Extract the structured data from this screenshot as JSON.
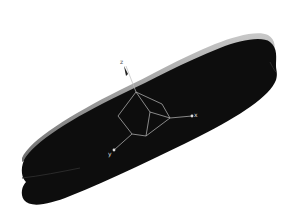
{
  "viewport": {
    "background": "#ffffff",
    "model": {
      "name": "disc",
      "fill_color": "#0d0d0d",
      "rim_color": "#8c8c8c"
    },
    "triad": {
      "line_color": "#bdbdbd",
      "axes": [
        {
          "id": "z",
          "label": "z"
        },
        {
          "id": "x",
          "label": "x"
        },
        {
          "id": "y",
          "label": "y"
        }
      ]
    }
  }
}
